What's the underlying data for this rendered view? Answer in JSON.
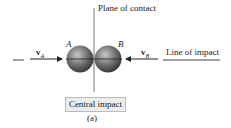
{
  "labels": {
    "plane": "Plane of contact",
    "line": "Line of impact",
    "a": "A",
    "b": "B",
    "va": "v",
    "va_sub": "A",
    "vb": "v",
    "vb_sub": "B",
    "caption": "Central impact",
    "figure": "(a)"
  },
  "colors": {
    "sphere": "#707070",
    "line": "#555555"
  }
}
